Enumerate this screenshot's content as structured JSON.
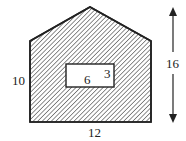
{
  "diagram": {
    "shape": "pentagon with rectangular hole",
    "labels": {
      "left_side": "10",
      "bottom": "12",
      "height_arrow": "16",
      "hole_width": "6",
      "hole_height": "3"
    },
    "colors": {
      "stroke": "#222222",
      "hatch": "#333333",
      "background": "#ffffff"
    }
  }
}
